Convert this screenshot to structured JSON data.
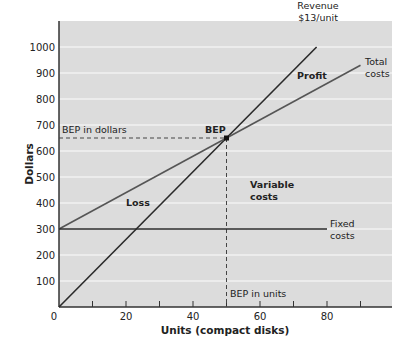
{
  "chart_data": {
    "type": "line",
    "title": "",
    "xlabel": "Units (compact disks)",
    "ylabel": "Dollars",
    "xlim": [
      0,
      100
    ],
    "ylim": [
      0,
      1100
    ],
    "x_ticks": [
      0,
      20,
      40,
      60,
      80
    ],
    "x_minor_ticks": [
      10,
      30,
      50,
      70,
      90
    ],
    "y_ticks": [
      100,
      200,
      300,
      400,
      500,
      600,
      700,
      800,
      900,
      1000
    ],
    "x_origin_label": "0",
    "grid": "horizontal",
    "series": [
      {
        "name": "Revenue $13/unit",
        "label_lines": [
          "Revenue",
          "$13/unit"
        ],
        "x": [
          0,
          76.9
        ],
        "y": [
          0,
          1000
        ],
        "color": "#2a2a2a"
      },
      {
        "name": "Total costs",
        "label_lines": [
          "Total",
          "costs"
        ],
        "x": [
          0,
          90
        ],
        "y": [
          300,
          930
        ],
        "color": "#555555"
      },
      {
        "name": "Fixed costs",
        "label_lines": [
          "Fixed",
          "costs"
        ],
        "x": [
          0,
          80
        ],
        "y": [
          300,
          300
        ],
        "color": "#2a2a2a"
      }
    ],
    "break_even_point": {
      "label": "BEP",
      "units": 50,
      "dollars": 650
    },
    "annotations": {
      "bep_dollars": "BEP in dollars",
      "bep_units": "BEP in units",
      "profit": "Profit",
      "loss": "Loss",
      "variable_costs": [
        "Variable",
        "costs"
      ]
    },
    "colors": {
      "plot_background": "#dcdcdc",
      "gridline": "#f2f2f2",
      "axis": "#333333"
    }
  }
}
